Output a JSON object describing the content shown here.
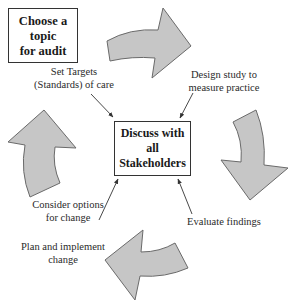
{
  "diagram": {
    "colors": {
      "arrow_fill": "#c6c6c6",
      "arrow_stroke": "#6a6a6a",
      "box_border": "#333333",
      "pointer": "#333333"
    },
    "start_box": {
      "line1": "Choose a topic",
      "line2": "for audit"
    },
    "center_box": {
      "line1": "Discuss with all",
      "line2": "Stakeholders"
    },
    "steps": [
      {
        "id": "set-targets",
        "line1": "Set Targets",
        "line2": "(Standards) of care"
      },
      {
        "id": "design-study",
        "line1": "Design study to",
        "line2": "measure practice"
      },
      {
        "id": "evaluate",
        "line1": "Evaluate findings",
        "line2": ""
      },
      {
        "id": "consider-options",
        "line1": "Consider options",
        "line2": "for change"
      },
      {
        "id": "plan-implement",
        "line1": "Plan and implement",
        "line2": "change"
      }
    ],
    "cycle_arrows": [
      {
        "id": "top",
        "direction": "clockwise"
      },
      {
        "id": "right",
        "direction": "clockwise"
      },
      {
        "id": "bottom",
        "direction": "clockwise"
      },
      {
        "id": "left",
        "direction": "clockwise"
      }
    ]
  }
}
